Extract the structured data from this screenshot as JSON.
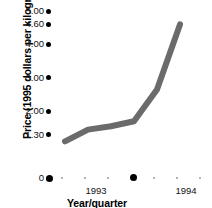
{
  "chart_data": {
    "type": "line",
    "title": "",
    "subtitle": "",
    "xlabel": "Year/quarter",
    "ylabel": "Price (1995 dollars per kilogram)",
    "ylim": [
      0,
      5.0
    ],
    "ytick_labels": [
      "5.00",
      "4.60",
      "4.00",
      "3.00",
      "2.00",
      "1.30",
      "0"
    ],
    "ytick_values": [
      5.0,
      4.6,
      4.0,
      3.0,
      2.0,
      1.3,
      0
    ],
    "xtick_labels": [
      "1993",
      "1994"
    ],
    "x_major_positions": [
      1993,
      1994
    ],
    "grid": false,
    "legend": null,
    "series": [
      {
        "name": "Price",
        "x": [
          0,
          1,
          2,
          3,
          4,
          5
        ],
        "values": [
          1.1,
          1.45,
          1.55,
          1.7,
          2.65,
          4.6
        ]
      }
    ],
    "line_color": "#6b6b6b",
    "line_width": 6,
    "marker_color": "#000000",
    "annotations": []
  },
  "axis": {
    "y_title": "Price (1995 dollars per kilogram)",
    "x_title": "Year/quarter",
    "y_ticks": [
      {
        "label": "5.00",
        "value": 5.0
      },
      {
        "label": "4.60",
        "value": 4.6
      },
      {
        "label": "4.00",
        "value": 4.0
      },
      {
        "label": "3.00",
        "value": 3.0
      },
      {
        "label": "2.00",
        "value": 2.0
      },
      {
        "label": "1.30",
        "value": 1.3
      },
      {
        "label": "0",
        "value": 0
      }
    ],
    "x_ticks": [
      {
        "label": "1993",
        "major": true
      },
      {
        "label": "1994",
        "major": true
      }
    ]
  },
  "colors": {
    "line": "#6b6b6b",
    "tick": "#000000",
    "minor_tick": "#9a9a9a",
    "text": "#111111",
    "background": "#ffffff"
  }
}
